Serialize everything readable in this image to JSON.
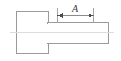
{
  "drawing": {
    "title": "Bolt side view with dimension A",
    "background_color": "#ffffff",
    "line_color": "#8a8a8a",
    "outline_color": "#9a9a9a",
    "centerline_color": "#d8d8d8",
    "dimension_color": "#6e6e6e",
    "text_color": "#3a3a3a",
    "dimension": {
      "label": "A",
      "label_x": 75,
      "label_y": 12,
      "line_y": 15.5,
      "start_x": 57.5,
      "end_x": 93.5,
      "extension_top_y": 8,
      "extension_bottom_y": 23,
      "arrow_size": 4
    },
    "shapes": [
      {
        "name": "bolt-head",
        "type": "rect",
        "x": 16.5,
        "y": 11.5,
        "width": 31.5,
        "height": 41.5
      },
      {
        "name": "bolt-shaft",
        "type": "rect",
        "x": 47.5,
        "y": 22.5,
        "width": 60.5,
        "height": 20.5
      }
    ],
    "centerline": {
      "name": "axis-centerline",
      "x1": 10,
      "x2": 114,
      "y": 32.5
    }
  }
}
